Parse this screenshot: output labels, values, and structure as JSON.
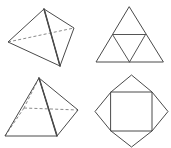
{
  "sheet": {
    "title": "Polyhedra and their nets",
    "width": 148,
    "background_color": "#ffffff",
    "line_color": "#4a4a4a",
    "hidden_line_color": "#8a8a8a"
  },
  "figures": [
    {
      "id": "tetrahedron-solid",
      "name": "Triangular pyramid (tetrahedron)",
      "kind": "solid",
      "position": "top-left",
      "faces": 4,
      "edges": 6,
      "vertices": 4,
      "base_shape": "triangle",
      "hidden_edges": 2,
      "vertex_points": {
        "apex": [
          44,
          9
        ],
        "left": [
          8,
          42
        ],
        "right": [
          74,
          28
        ],
        "front": [
          60,
          66
        ]
      },
      "visible_edges": [
        [
          [
            44,
            9
          ],
          [
            8,
            42
          ]
        ],
        [
          [
            44,
            9
          ],
          [
            74,
            28
          ]
        ],
        [
          [
            44,
            9
          ],
          [
            60,
            66
          ]
        ],
        [
          [
            8,
            42
          ],
          [
            60,
            66
          ]
        ],
        [
          [
            74,
            28
          ],
          [
            60,
            66
          ]
        ]
      ],
      "hidden_edge_list": [
        [
          [
            8,
            42
          ],
          [
            74,
            28
          ]
        ]
      ]
    },
    {
      "id": "tetrahedron-net",
      "name": "Net of triangular pyramid",
      "kind": "net",
      "position": "top-right",
      "outline_shape": "large triangle",
      "face_count": 4,
      "outer_points": [
        [
          129,
          7
        ],
        [
          96,
          62
        ],
        [
          163,
          62
        ]
      ],
      "midpoints": [
        [
          112.5,
          34.5
        ],
        [
          145.5,
          34.5
        ],
        [
          129.5,
          62
        ]
      ],
      "fold_lines": [
        [
          [
            112.5,
            34.5
          ],
          [
            145.5,
            34.5
          ]
        ],
        [
          [
            112.5,
            34.5
          ],
          [
            129.5,
            62
          ]
        ],
        [
          [
            145.5,
            34.5
          ],
          [
            129.5,
            62
          ]
        ]
      ]
    },
    {
      "id": "square-pyramid-solid",
      "name": "Square pyramid",
      "kind": "solid",
      "position": "bottom-left",
      "faces": 5,
      "edges": 8,
      "vertices": 5,
      "base_shape": "square",
      "hidden_edges": 3,
      "vertex_points": {
        "apex": [
          39,
          78
        ],
        "base_left": [
          5,
          136
        ],
        "base_front": [
          57,
          136
        ],
        "base_right": [
          78,
          110
        ],
        "base_back": [
          24,
          108
        ]
      },
      "visible_edges": [
        [
          [
            39,
            78
          ],
          [
            5,
            136
          ]
        ],
        [
          [
            39,
            78
          ],
          [
            57,
            136
          ]
        ],
        [
          [
            39,
            78
          ],
          [
            78,
            110
          ]
        ],
        [
          [
            5,
            136
          ],
          [
            57,
            136
          ]
        ],
        [
          [
            57,
            136
          ],
          [
            78,
            110
          ]
        ]
      ],
      "hidden_edge_list": [
        [
          [
            39,
            78
          ],
          [
            24,
            108
          ]
        ],
        [
          [
            24,
            108
          ],
          [
            5,
            136
          ]
        ],
        [
          [
            24,
            108
          ],
          [
            78,
            110
          ]
        ]
      ]
    },
    {
      "id": "square-pyramid-net",
      "name": "Net of square pyramid",
      "kind": "net",
      "position": "bottom-right",
      "outline_shape": "four-pointed star",
      "face_count": 5,
      "square_points": [
        [
          111,
          92
        ],
        [
          152,
          92
        ],
        [
          152,
          131
        ],
        [
          111,
          131
        ]
      ],
      "apex_points": {
        "top": [
          131.5,
          75
        ],
        "right": [
          168,
          111.5
        ],
        "bottom": [
          131.5,
          147
        ],
        "left": [
          95,
          111.5
        ]
      }
    }
  ],
  "legend": {
    "solid_line_label": "visible edge",
    "dashed_line_label": "hidden edge",
    "fold_line_label": "fold line"
  }
}
